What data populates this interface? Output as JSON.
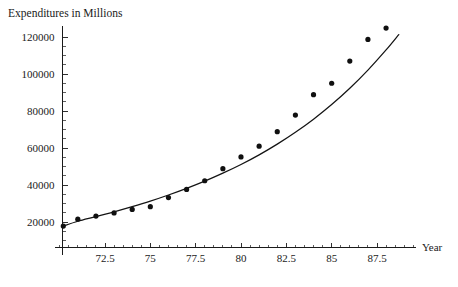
{
  "chart_data": {
    "type": "scatter",
    "title": "Expenditures in Millions",
    "xlabel": "Year",
    "ylabel": "",
    "xlim": [
      70.1,
      89.8
    ],
    "ylim": [
      0,
      132000
    ],
    "grid": false,
    "legend": "none",
    "x_ticks": [
      72.5,
      75,
      77.5,
      80,
      82.5,
      85,
      87.5
    ],
    "x_tick_labels": [
      "72.5",
      "75",
      "77.5",
      "80",
      "82.5",
      "85",
      "87.5"
    ],
    "y_ticks": [
      20000,
      40000,
      60000,
      80000,
      100000,
      120000
    ],
    "y_tick_labels": [
      "20000",
      "40000",
      "60000",
      "80000",
      "100000",
      "120000"
    ],
    "x_minor_step": 0.5,
    "y_minor_step": 5000,
    "series": [
      {
        "name": "data-points",
        "kind": "scatter",
        "marker": "filled-circle",
        "x": [
          70.2,
          71.0,
          72.0,
          73.0,
          74.0,
          75.0,
          76.0,
          77.0,
          78.0,
          79.0,
          80.0,
          81.0,
          82.0,
          83.0,
          84.0,
          85.0,
          86.0,
          87.0,
          88.0,
          89.0
        ],
        "y": [
          17800,
          21500,
          23200,
          24900,
          26800,
          28300,
          33200,
          37600,
          42300,
          48800,
          55200,
          61000,
          68800,
          77800,
          88800,
          95000,
          107000,
          118700,
          124800,
          null
        ]
      },
      {
        "name": "fitted-curve",
        "kind": "line",
        "x": [
          70.15,
          71.0,
          72.0,
          73.0,
          74.0,
          75.0,
          76.0,
          77.0,
          78.0,
          79.0,
          80.0,
          81.0,
          82.0,
          83.0,
          84.0,
          85.0,
          86.0,
          87.0,
          88.0,
          88.7
        ],
        "y": [
          17600,
          20400,
          22900,
          25500,
          28300,
          31300,
          34600,
          38200,
          42100,
          46400,
          51100,
          56300,
          62100,
          68500,
          75600,
          83500,
          92300,
          102100,
          113000,
          121300
        ]
      }
    ]
  },
  "colors": {
    "axis": "#1a1a1a",
    "marker": "#101010",
    "curve": "#141414",
    "background": "#ffffff"
  }
}
